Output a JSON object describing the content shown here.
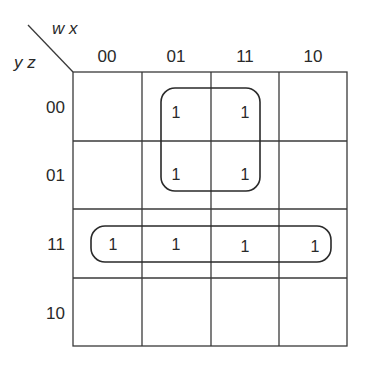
{
  "kmap": {
    "col_var_label": "w x",
    "row_var_label": "y z",
    "col_headers": [
      "00",
      "01",
      "11",
      "10"
    ],
    "row_headers": [
      "00",
      "01",
      "11",
      "10"
    ],
    "cells": [
      [
        "",
        "1",
        "1",
        ""
      ],
      [
        "",
        "1",
        "1",
        ""
      ],
      [
        "1",
        "1",
        "1",
        "1"
      ],
      [
        "",
        "",
        "",
        ""
      ]
    ],
    "groups": [
      {
        "name": "quad-group",
        "cells": [
          [
            0,
            1
          ],
          [
            0,
            2
          ],
          [
            1,
            1
          ],
          [
            1,
            2
          ]
        ]
      },
      {
        "name": "row-group",
        "cells": [
          [
            2,
            0
          ],
          [
            2,
            1
          ],
          [
            2,
            2
          ],
          [
            2,
            3
          ]
        ]
      }
    ]
  },
  "colors": {
    "line": "#3a3a3a",
    "text": "#2a2a2a",
    "background": "#ffffff"
  }
}
